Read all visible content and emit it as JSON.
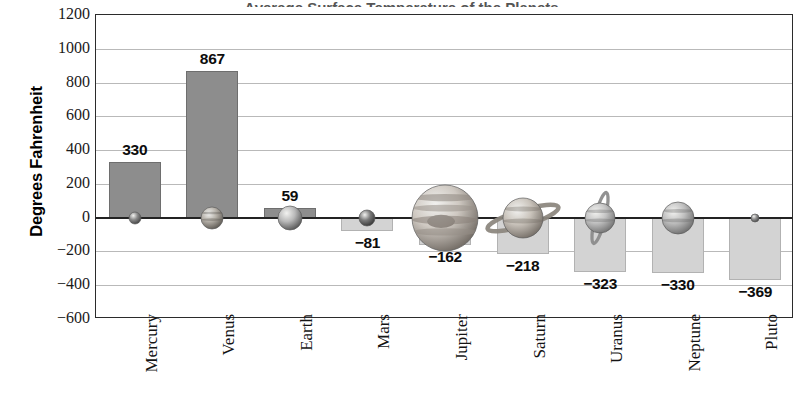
{
  "chart_data": {
    "type": "bar",
    "title": "Average Surface Temperature of the Planets",
    "xlabel": "",
    "ylabel": "Degrees Fahrenheit",
    "ylim": [
      -600,
      1200
    ],
    "ytick_step": 200,
    "grid": true,
    "legend": "none",
    "categories": [
      "Mercury",
      "Venus",
      "Earth",
      "Mars",
      "Jupiter",
      "Saturn",
      "Uranus",
      "Neptune",
      "Pluto"
    ],
    "values": [
      330,
      867,
      59,
      -81,
      -162,
      -218,
      -323,
      -330,
      -369
    ],
    "value_labels": [
      "330",
      "867",
      "59",
      "−81",
      "−162",
      "−218",
      "−323",
      "−330",
      "−369"
    ],
    "yticks": [
      "1200",
      "1000",
      "800",
      "600",
      "400",
      "200",
      "0",
      "−200",
      "−400",
      "−600"
    ],
    "ytick_values": [
      1200,
      1000,
      800,
      600,
      400,
      200,
      0,
      -200,
      -400,
      -600
    ],
    "icons": [
      "planet-mercury-icon",
      "planet-venus-icon",
      "planet-earth-icon",
      "planet-mars-icon",
      "planet-jupiter-icon",
      "planet-saturn-icon",
      "planet-uranus-icon",
      "planet-neptune-icon",
      "planet-pluto-icon"
    ],
    "colors": {
      "positive_bar": "#8d8d8d",
      "negative_bar": "#d3d3d3",
      "gridline": "#b9b9b9",
      "axis": "#2b2b2b",
      "text": "#0d0d0d"
    }
  }
}
